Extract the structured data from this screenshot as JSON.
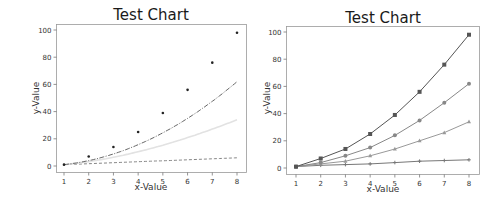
{
  "chart_data": [
    {
      "type": "scatter",
      "title": "Test Chart",
      "xlabel": "x-Value",
      "ylabel": "y-Value",
      "x": [
        1,
        2,
        3,
        4,
        5,
        6,
        7,
        8
      ],
      "xticks": [
        1,
        2,
        3,
        4,
        5,
        6,
        7,
        8
      ],
      "yticks": [
        0,
        20,
        40,
        60,
        80,
        100
      ],
      "xlim": [
        0.7,
        8.3
      ],
      "ylim": [
        -4,
        104
      ],
      "grid": false,
      "series": [
        {
          "name": "points",
          "style": "scatter-dots",
          "color": "#222222",
          "values": [
            1,
            7,
            14,
            25,
            39,
            56,
            76,
            98
          ]
        },
        {
          "name": "dash-dot curve",
          "style": "dash-dot",
          "color": "#555555",
          "values": [
            1,
            4,
            9,
            15,
            24,
            35,
            48,
            62
          ]
        },
        {
          "name": "light curve",
          "style": "solid-light",
          "color": "#e2e2e2",
          "values": [
            1,
            3,
            5,
            9,
            14,
            20,
            26,
            34
          ]
        },
        {
          "name": "dashed line",
          "style": "dashed",
          "color": "#777777",
          "values": [
            1,
            2,
            2.5,
            3,
            4,
            5,
            5.5,
            6
          ]
        }
      ]
    },
    {
      "type": "line",
      "title": "Test Chart",
      "xlabel": "x-Value",
      "ylabel": "y-Value",
      "x": [
        1,
        2,
        3,
        4,
        5,
        6,
        7,
        8
      ],
      "xticks": [
        1,
        2,
        3,
        4,
        5,
        6,
        7,
        8
      ],
      "yticks": [
        0,
        20,
        40,
        60,
        80,
        100
      ],
      "xlim": [
        0.7,
        8.3
      ],
      "ylim": [
        -4,
        104
      ],
      "grid": false,
      "series": [
        {
          "name": "squares",
          "marker": "square",
          "color": "#555555",
          "values": [
            1,
            7,
            14,
            25,
            39,
            56,
            76,
            98
          ]
        },
        {
          "name": "circles",
          "marker": "circle",
          "color": "#888888",
          "values": [
            1,
            4,
            9,
            15,
            24,
            35,
            48,
            62
          ]
        },
        {
          "name": "triangles",
          "marker": "triangle",
          "color": "#999999",
          "values": [
            1,
            3,
            5,
            9,
            14,
            20,
            26,
            34
          ]
        },
        {
          "name": "stars",
          "marker": "star",
          "color": "#777777",
          "values": [
            1,
            2,
            2.5,
            3,
            4,
            5,
            5.5,
            6
          ]
        }
      ]
    }
  ]
}
